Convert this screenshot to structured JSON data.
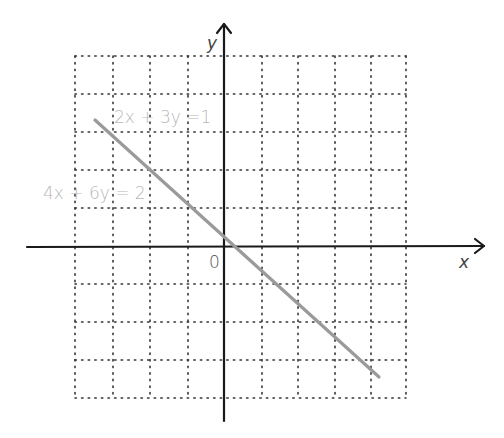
{
  "figure": {
    "axes": {
      "x_label": "x",
      "y_label": "y",
      "origin_label": "0"
    },
    "grid": {
      "columns": 9,
      "rows": 9,
      "style": "dotted"
    },
    "line": {
      "color": "#9a9a9a",
      "labels": [
        "2x + 3y =1",
        "4x + 6y = 2"
      ]
    },
    "colors": {
      "axis": "#1a1a1a",
      "grid": "#333333",
      "label": "#b8b8b8",
      "axis_label": "#444444"
    }
  }
}
